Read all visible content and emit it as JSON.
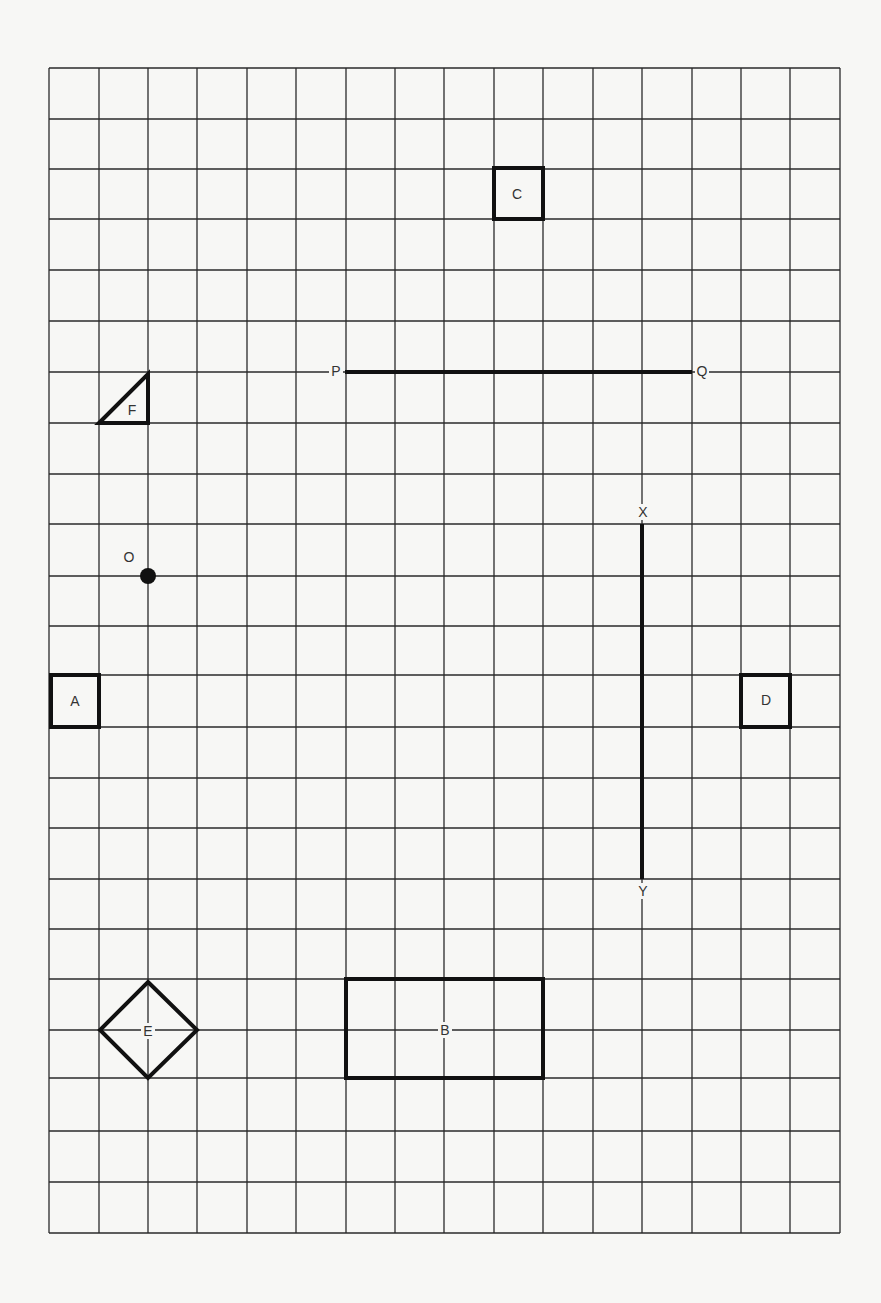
{
  "diagram": {
    "type": "grid-worksheet",
    "grid": {
      "columns": 16,
      "rows": 23,
      "x_lines": [
        49,
        99,
        148,
        197,
        247,
        296,
        346,
        395,
        444,
        494,
        543,
        593,
        642,
        692,
        741,
        790,
        840
      ],
      "y_lines": [
        68,
        119,
        169,
        219,
        270,
        321,
        372,
        423,
        474,
        524,
        576,
        626,
        675,
        727,
        778,
        828,
        879,
        929,
        979,
        1030,
        1078,
        1131,
        1182,
        1233
      ],
      "line_color": "#2a2a2a",
      "background_color": "#f7f7f5"
    },
    "shapes": [
      {
        "id": "A",
        "label": "A",
        "kind": "square",
        "x": 51,
        "y": 675,
        "w": 48,
        "h": 52,
        "label_x": 75,
        "label_y": 701
      },
      {
        "id": "B",
        "label": "B",
        "kind": "rectangle",
        "x": 346,
        "y": 979,
        "w": 197,
        "h": 99,
        "label_x": 445,
        "label_y": 1030
      },
      {
        "id": "C",
        "label": "C",
        "kind": "square",
        "x": 494,
        "y": 168,
        "w": 49,
        "h": 51,
        "label_x": 517,
        "label_y": 194
      },
      {
        "id": "D",
        "label": "D",
        "kind": "square",
        "x": 741,
        "y": 675,
        "w": 49,
        "h": 52,
        "label_x": 766,
        "label_y": 700
      },
      {
        "id": "E",
        "label": "E",
        "kind": "diamond",
        "points": "148,982 197,1030 148,1078 100,1030",
        "label_x": 148,
        "label_y": 1031
      },
      {
        "id": "F",
        "label": "F",
        "kind": "right-triangle",
        "points": "99,423 148,374 148,423",
        "label_x": 132,
        "label_y": 410
      }
    ],
    "segments": [
      {
        "id": "PQ",
        "from_label": "P",
        "to_label": "Q",
        "x1": 345,
        "y1": 372,
        "x2": 692,
        "y2": 372,
        "from_label_x": 336,
        "from_label_y": 371,
        "to_label_x": 702,
        "to_label_y": 371
      },
      {
        "id": "XY",
        "from_label": "X",
        "to_label": "Y",
        "x1": 642,
        "y1": 524,
        "x2": 642,
        "y2": 879,
        "from_label_x": 643,
        "from_label_y": 512,
        "to_label_x": 643,
        "to_label_y": 891
      }
    ],
    "points": [
      {
        "id": "O",
        "label": "O",
        "cx": 148,
        "cy": 576,
        "r": 8,
        "label_x": 129,
        "label_y": 557
      }
    ]
  }
}
